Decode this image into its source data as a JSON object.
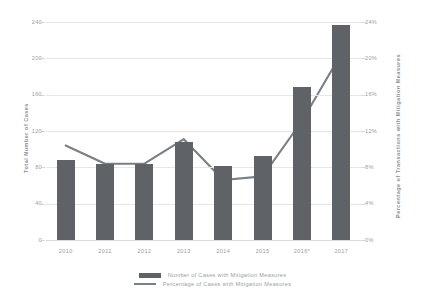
{
  "chart_data": {
    "type": "bar",
    "title": "",
    "subtitle": "",
    "categories": [
      "2010",
      "2011",
      "2012",
      "2013",
      "2014",
      "2015",
      "2016*",
      "2017"
    ],
    "xlabel": "",
    "ylabel": "Total Number of Cases",
    "y2label": "Percentage of Transactions with Mitigation Measures",
    "ylim": [
      0,
      240
    ],
    "y2lim": [
      0,
      24
    ],
    "yticks": [
      "0",
      "40",
      "80",
      "120",
      "160",
      "200",
      "240"
    ],
    "ytick_values": [
      0,
      40,
      80,
      120,
      160,
      200,
      240
    ],
    "y2ticks": [
      "0%",
      "4%",
      "8%",
      "12%",
      "16%",
      "20%",
      "24%"
    ],
    "y2tick_values": [
      0,
      4,
      8,
      12,
      16,
      20,
      24
    ],
    "grid": true,
    "legend_position": "bottom",
    "series": [
      {
        "name": "Number of Cases with Mitigation Measures",
        "type": "bar",
        "axis": "left",
        "color": "#5f6368",
        "values": [
          88,
          84,
          84,
          108,
          82,
          93,
          168,
          237
        ]
      },
      {
        "name": "Percentage of Cases with Mitigation Measures",
        "type": "line",
        "axis": "right",
        "color": "#7a7f85",
        "values": [
          10.4,
          8.4,
          8.4,
          11.1,
          6.6,
          7.0,
          13.1,
          20.5
        ]
      }
    ],
    "annotations": [
      "2016*"
    ]
  },
  "legend": {
    "bar_label": "Number of Cases with Mitigation Measures",
    "line_label": "Percentage of Cases with Mitigation Measures",
    "bar_swatch_name": "bar-swatch",
    "line_swatch_name": "line-swatch"
  },
  "axes": {
    "left_title": "Total Number of Cases",
    "right_title": "Percentage of Transactions with Mitigation Measures"
  }
}
